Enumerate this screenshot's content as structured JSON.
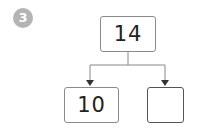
{
  "badge": {
    "number": "3",
    "color": "#b4b4b4"
  },
  "diagram": {
    "type": "number-bond",
    "whole": "14",
    "parts": [
      {
        "value": "10"
      },
      {
        "value": ""
      }
    ]
  }
}
